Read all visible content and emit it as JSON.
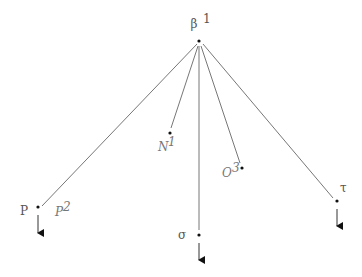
{
  "diagram": {
    "type": "tree",
    "root": {
      "id": "beta",
      "label": "β",
      "sup": "1"
    },
    "children": [
      {
        "id": "P",
        "label": "P",
        "extra_label": "P",
        "extra_sup": "2",
        "has_arrow": true
      },
      {
        "id": "N",
        "label": "N",
        "sup": "1",
        "has_arrow": false
      },
      {
        "id": "sigma",
        "label": "σ",
        "has_arrow": true
      },
      {
        "id": "O",
        "label": "O",
        "sup": "3",
        "has_arrow": false
      },
      {
        "id": "tau",
        "label": "τ",
        "has_arrow": true
      }
    ]
  }
}
